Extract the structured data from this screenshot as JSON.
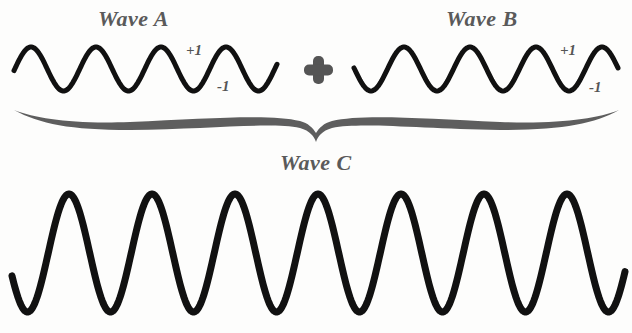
{
  "colors": {
    "wave": "#111111",
    "label": "#5a5a5a",
    "brace": "#5e5e5e",
    "plus": "#555555",
    "background": "#fdfdfc"
  },
  "labels": {
    "wave_a": "Wave A",
    "wave_b": "Wave B",
    "wave_c": "Wave C",
    "plus_symbol": "+",
    "wave_a_max": "+1",
    "wave_a_min": "-1",
    "wave_b_max": "+1",
    "wave_b_min": "-1"
  },
  "waves": {
    "wave_a": {
      "x_start": 14,
      "x_end": 277,
      "center_y": 69,
      "amplitude": 22,
      "period": 65,
      "first_peak_x": 31,
      "stroke": 5,
      "amplitude_value": 1
    },
    "wave_b": {
      "x_start": 354,
      "x_end": 618,
      "center_y": 69,
      "amplitude": 22,
      "period": 66,
      "first_peak_x": 404,
      "stroke": 5,
      "amplitude_value": 1
    },
    "wave_c": {
      "x_start": 12,
      "x_end": 625,
      "center_y": 253,
      "amplitude": 59,
      "period": 83,
      "first_peak_x": 69,
      "stroke": 7,
      "amplitude_value": 2
    }
  },
  "relation": "Wave A + Wave B = Wave C (constructive interference)"
}
